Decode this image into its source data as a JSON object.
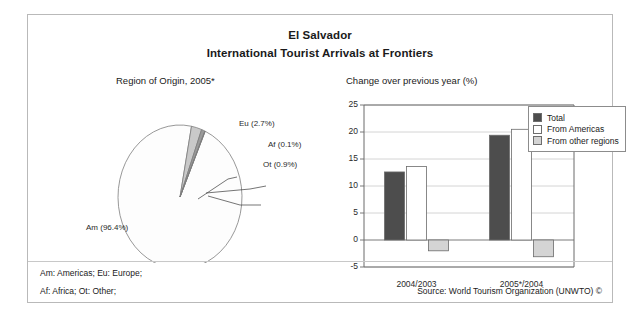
{
  "figure": {
    "title_main": "El Salvador",
    "title_sub": "International Tourist Arrivals at Frontiers",
    "notes": {
      "line1": "Am: Americas; Eu: Europe;",
      "line2": "Af: Africa; Ot: Other;",
      "source": "Source: World Tourism Organization (UNWTO) ©"
    }
  },
  "pie_panel": {
    "title": "Region of Origin, 2005*",
    "labels": {
      "eu": "Eu (2.7%)",
      "af": "Af (0.1%)",
      "ot": "Ot (0.9%)",
      "am": "Am (96.4%)"
    }
  },
  "bar_panel": {
    "title": "Change over previous year (%)",
    "legend": [
      {
        "label": "Total",
        "color": "#4d4d4d"
      },
      {
        "label": "From Americas",
        "color": "#ffffff"
      },
      {
        "label": "From other regions",
        "color": "#d4d4d4"
      }
    ]
  },
  "chart_data": [
    {
      "type": "pie",
      "title": "Region of Origin, 2005*",
      "categories": [
        "Am",
        "Eu",
        "Ot",
        "Af"
      ],
      "labels": [
        "Am (96.4%)",
        "Eu (2.7%)",
        "Ot (0.9%)",
        "Af (0.1%)"
      ],
      "values": [
        96.4,
        2.7,
        0.9,
        0.1
      ],
      "units": "percent",
      "colors": [
        "#fdfdfd",
        "#c9c9c9",
        "#9a9a9a",
        "#6f6f6f"
      ],
      "legend": "labels-outside"
    },
    {
      "type": "bar",
      "title": "Change over previous year (%)",
      "categories": [
        "2004/2003",
        "2005*/2004"
      ],
      "series": [
        {
          "name": "Total",
          "values": [
            12.6,
            19.4
          ],
          "color": "#4d4d4d"
        },
        {
          "name": "From Americas",
          "values": [
            13.6,
            20.5
          ],
          "color": "#ffffff"
        },
        {
          "name": "From other regions",
          "values": [
            -2.0,
            -3.1
          ],
          "color": "#d4d4d4"
        }
      ],
      "xlabel": "",
      "ylabel": "",
      "ylim": [
        -5,
        25
      ],
      "yticks": [
        -5,
        0,
        5,
        10,
        15,
        20,
        25
      ],
      "grid": true,
      "legend_position": "top-right"
    }
  ]
}
